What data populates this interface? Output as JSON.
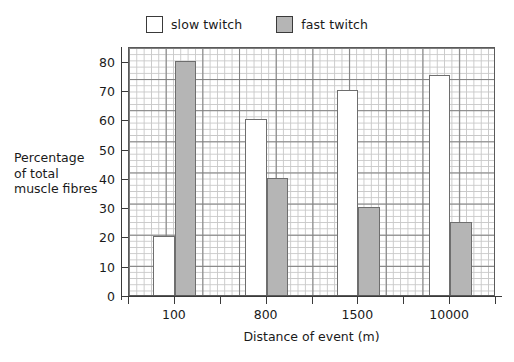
{
  "chart_data": {
    "type": "bar",
    "title": "",
    "subtitle": "",
    "xlabel": "Distance of event (m)",
    "ylabel": "Percentage of total muscle fibres",
    "ylabel_lines": [
      "Percentage",
      "of total",
      "muscle fibres"
    ],
    "categories": [
      "100",
      "800",
      "1500",
      "10000"
    ],
    "series": [
      {
        "name": "slow twitch",
        "color": "#ffffff",
        "values": [
          20,
          60,
          70,
          75
        ]
      },
      {
        "name": "fast twitch",
        "color": "#b5b5b5",
        "values": [
          80,
          40,
          30,
          25
        ]
      }
    ],
    "ylim": [
      0,
      85
    ],
    "yticks": [
      0,
      10,
      20,
      30,
      40,
      50,
      60,
      70,
      80
    ],
    "ytick_labels": [
      "0",
      "10",
      "20",
      "30",
      "40",
      "50",
      "60",
      "70",
      "80"
    ],
    "xlim": [
      0,
      4
    ],
    "grid": true,
    "grid_minor": true,
    "legend_position": "top-center"
  },
  "legend": {
    "entries": [
      {
        "label": "slow twitch",
        "swatch": "white-square-icon"
      },
      {
        "label": "fast twitch",
        "swatch": "grey-square-icon"
      }
    ]
  },
  "colors": {
    "slow_twitch": "#ffffff",
    "fast_twitch": "#b5b5b5",
    "bar_outline": "#6e6e6e",
    "axis": "#3a3a3a",
    "grid_major": "#7d7d7d",
    "grid_minor": "#c8c8c8",
    "text": "#1a1a1a"
  }
}
